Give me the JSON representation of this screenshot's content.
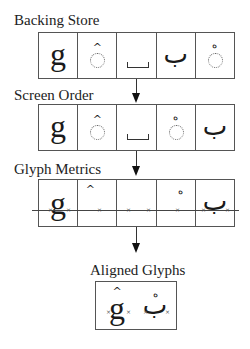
{
  "diagram": {
    "stages": [
      {
        "title": "Backing Store",
        "cells": [
          "g",
          "combining circumflex",
          "space",
          "ب",
          "combining sukun"
        ]
      },
      {
        "title": "Screen Order",
        "cells": [
          "g",
          "combining circumflex",
          "space",
          "combining sukun",
          "ب"
        ]
      },
      {
        "title": "Glyph Metrics",
        "cells": [
          "g",
          "^",
          "space",
          "ْ",
          "ب"
        ]
      },
      {
        "title": "Aligned Glyphs",
        "cells": [
          "ĝ",
          "بْ"
        ]
      }
    ],
    "glyphs": {
      "latin_g": "g",
      "circumflex": "^",
      "arabic_ba": "ب",
      "sukun": "ه",
      "x_marker": "×"
    },
    "colors": {
      "line": "#555555",
      "text": "#222222",
      "background": "#ffffff"
    }
  }
}
